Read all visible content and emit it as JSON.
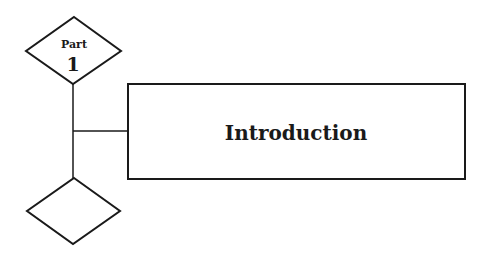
{
  "diagram": {
    "part_marker": {
      "label": "Part",
      "number": "1"
    },
    "title_box": {
      "text": "Introduction"
    },
    "bottom_marker": {
      "label": ""
    },
    "colors": {
      "stroke": "#1a1a1a",
      "background": "#ffffff"
    }
  }
}
